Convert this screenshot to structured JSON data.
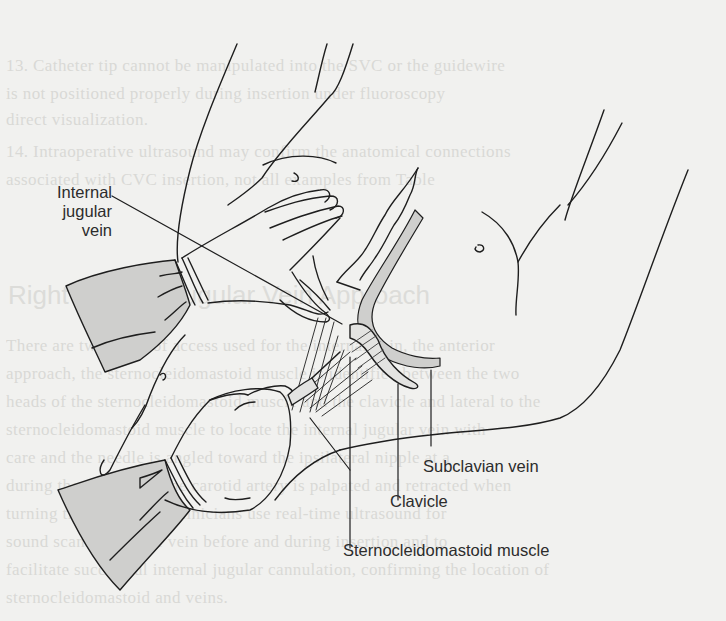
{
  "figure": {
    "type": "anatomical-illustration",
    "labels": {
      "internal_jugular_vein": [
        "Internal",
        "jugular",
        "vein"
      ],
      "subclavian_vein": "Subclavian vein",
      "clavicle": "Clavicle",
      "sternocleidomastoid_muscle": "Sternocleidomastoid muscle"
    },
    "colors": {
      "line": "#1e1e1e",
      "shading": "#cfcfcd",
      "label_text": "#2c2c2c",
      "background": "#f1f1ef"
    }
  },
  "background_bleed_through": {
    "heading": "Right Internal Jugular Vein Approach",
    "lines": [
      "13. Catheter tip cannot be manipulated into the SVC or the guidewire",
      "    is not positioned properly during insertion under fluoroscopy",
      "    direct visualization.",
      "14. Intraoperative ultrasound may confirm the anatomical connections",
      "    associated with CVC insertion, not all examples from Table",
      "There are two types of access used for the internal vein, the anterior",
      "approach, the sternocleidomastoid muscle is identified between the two",
      "heads of the sternocleidomastoid muscle and the clavicle and lateral to the",
      "sternocleidomastoid muscle to locate the internal jugular vein with",
      "care and the needle is angled toward the ipsilateral nipple at a",
      "during the procedure, the carotid artery is palpated and retracted when",
      "turning the head. Most clinicians use real-time ultrasound for",
      "sound scanning of the vein before and during insertion and to",
      "facilitate successful internal jugular cannulation, confirming the location of",
      "sternocleidomastoid and veins."
    ]
  }
}
